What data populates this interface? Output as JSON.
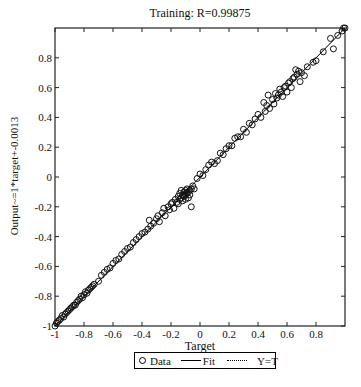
{
  "chart_data": {
    "type": "scatter",
    "title": "Training: R=0.99875",
    "xlabel": "Target",
    "ylabel": "Output~=1*target+-0.0013",
    "xlim": [
      -1,
      1
    ],
    "ylim": [
      -1,
      1
    ],
    "xticks": [
      -1,
      -0.8,
      -0.6,
      -0.4,
      -0.2,
      0,
      0.2,
      0.4,
      0.6,
      0.8
    ],
    "yticks": [
      -1,
      -0.8,
      -0.6,
      -0.4,
      -0.2,
      0,
      0.2,
      0.4,
      0.6,
      0.8
    ],
    "grid": false,
    "legend_position": "bottom-outside",
    "legend": [
      "Data",
      "Fit",
      "Y=T"
    ],
    "fit": {
      "slope": 1,
      "intercept": -0.0013,
      "R": 0.99875
    },
    "series": [
      {
        "name": "Data",
        "marker": "circle-open",
        "points": [
          [
            -1.0,
            -1.0
          ],
          [
            -0.99,
            -0.98
          ],
          [
            -0.98,
            -0.97
          ],
          [
            -0.97,
            -0.96
          ],
          [
            -0.96,
            -0.95
          ],
          [
            -0.95,
            -0.93
          ],
          [
            -0.94,
            -0.94
          ],
          [
            -0.93,
            -0.92
          ],
          [
            -0.92,
            -0.91
          ],
          [
            -0.91,
            -0.9
          ],
          [
            -0.9,
            -0.89
          ],
          [
            -0.89,
            -0.88
          ],
          [
            -0.88,
            -0.87
          ],
          [
            -0.87,
            -0.86
          ],
          [
            -0.86,
            -0.86
          ],
          [
            -0.85,
            -0.84
          ],
          [
            -0.84,
            -0.83
          ],
          [
            -0.83,
            -0.82
          ],
          [
            -0.82,
            -0.8
          ],
          [
            -0.81,
            -0.81
          ],
          [
            -0.8,
            -0.79
          ],
          [
            -0.79,
            -0.77
          ],
          [
            -0.78,
            -0.78
          ],
          [
            -0.77,
            -0.76
          ],
          [
            -0.76,
            -0.75
          ],
          [
            -0.75,
            -0.74
          ],
          [
            -0.74,
            -0.73
          ],
          [
            -0.73,
            -0.72
          ],
          [
            -0.7,
            -0.7
          ],
          [
            -0.68,
            -0.66
          ],
          [
            -0.66,
            -0.64
          ],
          [
            -0.64,
            -0.62
          ],
          [
            -0.62,
            -0.61
          ],
          [
            -0.6,
            -0.58
          ],
          [
            -0.58,
            -0.56
          ],
          [
            -0.56,
            -0.55
          ],
          [
            -0.54,
            -0.52
          ],
          [
            -0.52,
            -0.5
          ],
          [
            -0.5,
            -0.48
          ],
          [
            -0.48,
            -0.47
          ],
          [
            -0.46,
            -0.44
          ],
          [
            -0.44,
            -0.42
          ],
          [
            -0.42,
            -0.4
          ],
          [
            -0.4,
            -0.38
          ],
          [
            -0.38,
            -0.37
          ],
          [
            -0.36,
            -0.35
          ],
          [
            -0.35,
            -0.29
          ],
          [
            -0.34,
            -0.33
          ],
          [
            -0.32,
            -0.31
          ],
          [
            -0.3,
            -0.28
          ],
          [
            -0.29,
            -0.26
          ],
          [
            -0.28,
            -0.3
          ],
          [
            -0.26,
            -0.24
          ],
          [
            -0.25,
            -0.21
          ],
          [
            -0.24,
            -0.26
          ],
          [
            -0.22,
            -0.2
          ],
          [
            -0.21,
            -0.22
          ],
          [
            -0.2,
            -0.18
          ],
          [
            -0.19,
            -0.17
          ],
          [
            -0.18,
            -0.21
          ],
          [
            -0.17,
            -0.15
          ],
          [
            -0.16,
            -0.17
          ],
          [
            -0.15,
            -0.13
          ],
          [
            -0.15,
            -0.18
          ],
          [
            -0.14,
            -0.15
          ],
          [
            -0.14,
            -0.11
          ],
          [
            -0.13,
            -0.14
          ],
          [
            -0.13,
            -0.09
          ],
          [
            -0.12,
            -0.16
          ],
          [
            -0.12,
            -0.12
          ],
          [
            -0.11,
            -0.1
          ],
          [
            -0.11,
            -0.13
          ],
          [
            -0.1,
            -0.15
          ],
          [
            -0.1,
            -0.09
          ],
          [
            -0.1,
            -0.12
          ],
          [
            -0.09,
            -0.11
          ],
          [
            -0.09,
            -0.08
          ],
          [
            -0.08,
            -0.14
          ],
          [
            -0.08,
            -0.1
          ],
          [
            -0.07,
            -0.12
          ],
          [
            -0.07,
            -0.09
          ],
          [
            -0.06,
            -0.08
          ],
          [
            -0.06,
            -0.2
          ],
          [
            -0.05,
            -0.06
          ],
          [
            -0.04,
            -0.08
          ],
          [
            -0.02,
            -0.01
          ],
          [
            0.0,
            0.02
          ],
          [
            0.02,
            0.01
          ],
          [
            0.04,
            0.05
          ],
          [
            0.06,
            0.08
          ],
          [
            0.08,
            0.1
          ],
          [
            0.1,
            0.09
          ],
          [
            0.12,
            0.11
          ],
          [
            0.14,
            0.16
          ],
          [
            0.16,
            0.15
          ],
          [
            0.18,
            0.19
          ],
          [
            0.2,
            0.21
          ],
          [
            0.22,
            0.21
          ],
          [
            0.24,
            0.26
          ],
          [
            0.26,
            0.27
          ],
          [
            0.28,
            0.27
          ],
          [
            0.3,
            0.32
          ],
          [
            0.32,
            0.3
          ],
          [
            0.34,
            0.36
          ],
          [
            0.36,
            0.35
          ],
          [
            0.38,
            0.39
          ],
          [
            0.4,
            0.42
          ],
          [
            0.42,
            0.4
          ],
          [
            0.44,
            0.5
          ],
          [
            0.45,
            0.44
          ],
          [
            0.46,
            0.48
          ],
          [
            0.47,
            0.55
          ],
          [
            0.48,
            0.46
          ],
          [
            0.5,
            0.52
          ],
          [
            0.51,
            0.49
          ],
          [
            0.52,
            0.56
          ],
          [
            0.53,
            0.53
          ],
          [
            0.54,
            0.55
          ],
          [
            0.55,
            0.59
          ],
          [
            0.56,
            0.57
          ],
          [
            0.57,
            0.54
          ],
          [
            0.58,
            0.6
          ],
          [
            0.59,
            0.61
          ],
          [
            0.6,
            0.57
          ],
          [
            0.61,
            0.63
          ],
          [
            0.62,
            0.64
          ],
          [
            0.63,
            0.6
          ],
          [
            0.64,
            0.66
          ],
          [
            0.65,
            0.67
          ],
          [
            0.66,
            0.72
          ],
          [
            0.67,
            0.69
          ],
          [
            0.68,
            0.71
          ],
          [
            0.69,
            0.64
          ],
          [
            0.7,
            0.7
          ],
          [
            0.72,
            0.68
          ],
          [
            0.74,
            0.74
          ],
          [
            0.78,
            0.77
          ],
          [
            0.8,
            0.78
          ],
          [
            0.85,
            0.84
          ],
          [
            0.9,
            0.93
          ],
          [
            0.92,
            0.86
          ],
          [
            0.95,
            0.95
          ],
          [
            0.98,
            0.98
          ],
          [
            0.99,
            1.0
          ],
          [
            1.0,
            1.0
          ]
        ]
      },
      {
        "name": "Fit",
        "style": "solid",
        "x": [
          -1,
          1
        ],
        "y": [
          -1.0013,
          0.9987
        ]
      },
      {
        "name": "Y=T",
        "style": "dotted",
        "x": [
          -1,
          1
        ],
        "y": [
          -1,
          1
        ]
      }
    ]
  },
  "legend": {
    "data_label": "Data",
    "fit_label": "Fit",
    "yt_label": "Y=T"
  }
}
